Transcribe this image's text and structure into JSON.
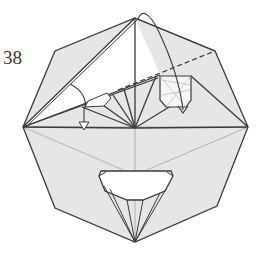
{
  "diagram": {
    "step_number": "38",
    "type": "origami-folding-step",
    "shape": "octagon",
    "colors": {
      "paper_fill": "#e6e6e6",
      "flap_fill": "#ffffff",
      "line": "#3a3a3a",
      "thin_line": "#9a9a9a",
      "background": "#ffffff"
    },
    "symbols": [
      {
        "name": "valley-fold-dashed-line",
        "kind": "dashed"
      },
      {
        "name": "fold-arrow-left",
        "kind": "arrow"
      },
      {
        "name": "fold-arrow-top",
        "kind": "arrow"
      },
      {
        "name": "push-down-arrow-left",
        "kind": "arrow"
      },
      {
        "name": "push-down-arrow-right",
        "kind": "arrow"
      }
    ]
  }
}
